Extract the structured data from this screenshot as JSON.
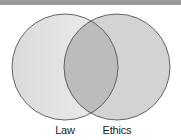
{
  "diagram": {
    "type": "venn",
    "sets": [
      {
        "label": "Law",
        "cx": 65,
        "cy": 67,
        "r": 53,
        "fill": "#e0e0e0"
      },
      {
        "label": "Ethics",
        "cx": 117,
        "cy": 67,
        "r": 53,
        "fill": "#d3d3d3"
      }
    ],
    "overlap_fill": "#bcbcbc",
    "stroke": "#555555",
    "top_band_color": "#9a9a9a"
  }
}
